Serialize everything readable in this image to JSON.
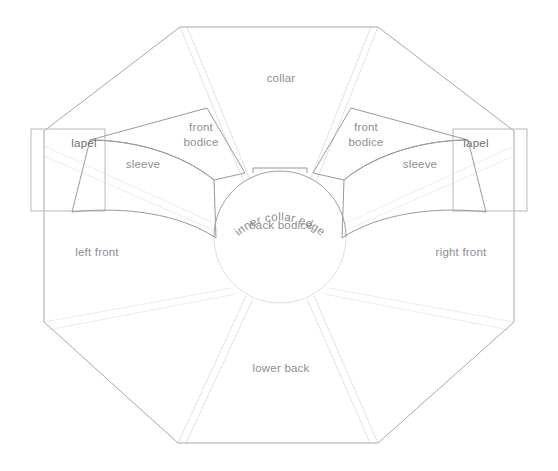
{
  "diagram": {
    "background_color": "#ffffff",
    "line_color": "#a8a8a8",
    "faint_line_color": "#e2e2e2",
    "label_color": "#8e8e93",
    "labels": {
      "collar": "collar",
      "front_bodice_left": "front\nbodice",
      "front_bodice_left_line1": "front",
      "front_bodice_left_line2": "bodice",
      "front_bodice_right_line1": "front",
      "front_bodice_right_line2": "bodice",
      "lapel_left": "lapel",
      "lapel_right": "lapel",
      "sleeve_left": "sleeve",
      "sleeve_right": "sleeve",
      "inner_collar_edge": "inner collar edge",
      "back_bodice": "back bodice",
      "left_front": "left front",
      "right_front": "right front",
      "lower_back": "lower back"
    },
    "panels": [
      {
        "name": "collar",
        "label": "collar",
        "position": "top-center"
      },
      {
        "name": "front-bodice-left",
        "label": "front bodice",
        "position": "upper-left"
      },
      {
        "name": "front-bodice-right",
        "label": "front bodice",
        "position": "upper-right"
      },
      {
        "name": "lapel-left",
        "label": "lapel",
        "position": "left-edge"
      },
      {
        "name": "lapel-right",
        "label": "lapel",
        "position": "right-edge"
      },
      {
        "name": "sleeve-left",
        "label": "sleeve",
        "position": "mid-left"
      },
      {
        "name": "sleeve-right",
        "label": "sleeve",
        "position": "mid-right"
      },
      {
        "name": "back-bodice",
        "label": "back bodice",
        "position": "center"
      },
      {
        "name": "left-front",
        "label": "left front",
        "position": "lower-left"
      },
      {
        "name": "right-front",
        "label": "right front",
        "position": "lower-right"
      },
      {
        "name": "lower-back",
        "label": "lower back",
        "position": "bottom-center"
      }
    ]
  }
}
